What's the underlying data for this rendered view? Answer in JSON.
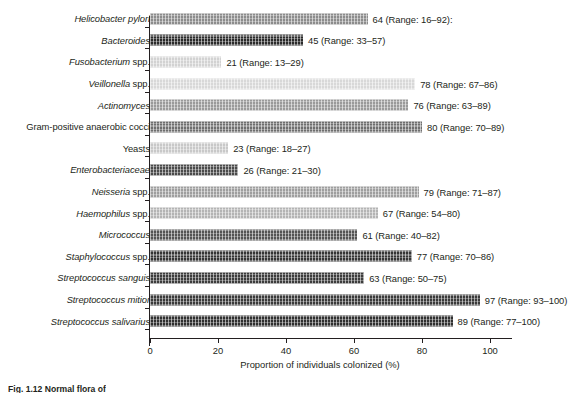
{
  "chart_data": {
    "type": "bar",
    "orientation": "horizontal",
    "title": "",
    "xlabel": "Proportion of individuals colonized (%)",
    "ylabel": "",
    "xlim": [
      0,
      100
    ],
    "xticks": [
      0,
      20,
      40,
      60,
      80,
      100
    ],
    "grid": false,
    "legend": false,
    "categories": [
      "Helicobacter pylori",
      "Bacteroides",
      "Fusobacterium spp.",
      "Veillonella spp.",
      "Actinomyces",
      "Gram-positive anaerobic cocci",
      "Yeasts",
      "Enterobacteriaceae",
      "Neisseria spp.",
      "Haemophilus spp.",
      "Micrococcus",
      "Staphylococcus spp.",
      "Streptococcus sanguis",
      "Streptococcus mitior",
      "Streptococcus salivarius"
    ],
    "values": [
      64,
      45,
      21,
      78,
      76,
      80,
      23,
      26,
      79,
      67,
      61,
      77,
      63,
      97,
      89
    ],
    "ranges": [
      [
        16,
        92
      ],
      [
        33,
        57
      ],
      [
        13,
        29
      ],
      [
        67,
        86
      ],
      [
        63,
        89
      ],
      [
        70,
        89
      ],
      [
        18,
        27
      ],
      [
        21,
        30
      ],
      [
        71,
        87
      ],
      [
        54,
        80
      ],
      [
        40,
        82
      ],
      [
        70,
        86
      ],
      [
        50,
        75
      ],
      [
        93,
        100
      ],
      [
        77,
        100
      ]
    ]
  },
  "rows": [
    {
      "label_italic": "Helicobacter pylori",
      "label_upright": "",
      "value": 64,
      "value_text": "64 (Range: 16–92):",
      "shade": "#8c8c8c"
    },
    {
      "label_italic": "Bacteroides",
      "label_upright": "",
      "value": 45,
      "value_text": "45 (Range: 33–57)",
      "shade": "#2b2b2b"
    },
    {
      "label_italic": "Fusobacterium",
      "label_upright": " spp.",
      "value": 21,
      "value_text": "21 (Range: 13–29)",
      "shade": "#d2d2d2"
    },
    {
      "label_italic": "Veillonella",
      "label_upright": " spp.",
      "value": 78,
      "value_text": "78 (Range: 67–86)",
      "shade": "#d8d8d8"
    },
    {
      "label_italic": "Actinomyces",
      "label_upright": "",
      "value": 76,
      "value_text": "76 (Range: 63–89)",
      "shade": "#9a9a9a"
    },
    {
      "label_italic": "",
      "label_upright": "Gram-positive anaerobic cocci",
      "value": 80,
      "value_text": "80 (Range: 70–89)",
      "shade": "#6e6e6e"
    },
    {
      "label_italic": "",
      "label_upright": "Yeasts",
      "value": 23,
      "value_text": "23 (Range: 18–27)",
      "shade": "#c8c8c8"
    },
    {
      "label_italic": "Enterobacteriaceae",
      "label_upright": "",
      "value": 26,
      "value_text": "26 (Range: 21–30)",
      "shade": "#4a4a4a"
    },
    {
      "label_italic": "Neisseria",
      "label_upright": " spp.",
      "value": 79,
      "value_text": "79 (Range: 71–87)",
      "shade": "#9e9e9e"
    },
    {
      "label_italic": "Haemophilus",
      "label_upright": " spp.",
      "value": 67,
      "value_text": "67 (Range: 54–80)",
      "shade": "#b4b4b4"
    },
    {
      "label_italic": "Micrococcus",
      "label_upright": "",
      "value": 61,
      "value_text": "61 (Range: 40–82)",
      "shade": "#545454"
    },
    {
      "label_italic": "Staphylococcus",
      "label_upright": " spp.",
      "value": 77,
      "value_text": "77 (Range: 70–86)",
      "shade": "#343434"
    },
    {
      "label_italic": "Streptococcus sanguis",
      "label_upright": "",
      "value": 63,
      "value_text": "63 (Range: 50–75)",
      "shade": "#3c3c3c"
    },
    {
      "label_italic": "Streptococcus mitior",
      "label_upright": "",
      "value": 97,
      "value_text": "97 (Range: 93–100)",
      "shade": "#3a3a3a"
    },
    {
      "label_italic": "Streptococcus salivarius",
      "label_upright": "",
      "value": 89,
      "value_text": "89 (Range: 77–100)",
      "shade": "#303030"
    }
  ],
  "axis": {
    "x_title": "Proportion of individuals colonized (%)",
    "ticks": [
      "0",
      "20",
      "40",
      "60",
      "80",
      "100"
    ]
  },
  "caption": {
    "text": "Fig. 1.12 Normal flora of"
  }
}
